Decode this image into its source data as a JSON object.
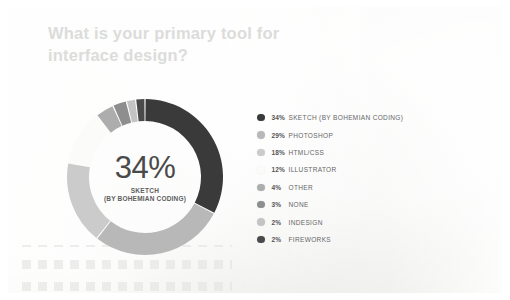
{
  "card": {
    "background_color": "#f2f2f0",
    "frame_color": "#ffffff"
  },
  "header": {
    "title_line_1": "What is your primary tool for",
    "title_line_2": "interface design?",
    "title_color": "#dcdcda"
  },
  "donut": {
    "center_value": "34%",
    "center_sub_1": "SKETCH",
    "center_sub_2": "(BY BOHEMIAN CODING)",
    "center_value_color": "#4a4a4a",
    "center_sub_color": "#5d5d5d",
    "outer_radius": 78,
    "ring_thickness": 22,
    "start_angle_deg": -90,
    "direction": "clockwise"
  },
  "legend": {
    "items": [
      {
        "pct": "34%",
        "label": "SKETCH (BY BOHEMIAN CODING)",
        "color": "#3a3a3a"
      },
      {
        "pct": "29%",
        "label": "PHOTOSHOP",
        "color": "#b8b8b8"
      },
      {
        "pct": "18%",
        "label": "HTML/CSS",
        "color": "#cbcbcb"
      },
      {
        "pct": "12%",
        "label": "ILLUSTRATOR",
        "color": "#fbfbfa"
      },
      {
        "pct": "4%",
        "label": "OTHER",
        "color": "#adadad"
      },
      {
        "pct": "3%",
        "label": "NONE",
        "color": "#8e8e8e"
      },
      {
        "pct": "2%",
        "label": "INDESIGN",
        "color": "#c4c4c4"
      },
      {
        "pct": "2%",
        "label": "FIREWORKS",
        "color": "#4a4a4a"
      }
    ]
  },
  "chart_data": {
    "type": "pie",
    "variant": "donut",
    "title": "What is your primary tool for interface design?",
    "categories": [
      "SKETCH (BY BOHEMIAN CODING)",
      "PHOTOSHOP",
      "HTML/CSS",
      "ILLUSTRATOR",
      "OTHER",
      "NONE",
      "INDESIGN",
      "FIREWORKS"
    ],
    "values": [
      34,
      29,
      18,
      12,
      4,
      3,
      2,
      2
    ],
    "unit": "percent",
    "colors": [
      "#3a3a3a",
      "#b8b8b8",
      "#cbcbcb",
      "#fbfbfa",
      "#adadad",
      "#8e8e8e",
      "#c4c4c4",
      "#4a4a4a"
    ],
    "center_label": "34%",
    "center_sublabel": "SKETCH (BY BOHEMIAN CODING)",
    "legend_position": "right",
    "grid": false,
    "xlabel": "",
    "ylabel": ""
  }
}
